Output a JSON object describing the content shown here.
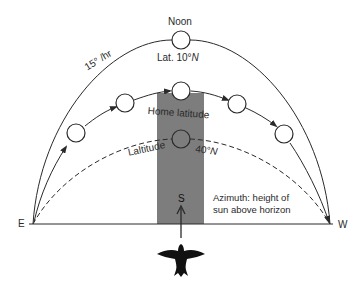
{
  "diagram": {
    "colors": {
      "line": "#2a2a2a",
      "band": "#7d7d7d",
      "background": "#ffffff"
    },
    "labels": {
      "noon": "Noon",
      "rate": "15° /hr",
      "lat_outer": "Lat. 10°",
      "lat_outer_n": "N",
      "home_latitude": "Home latitude",
      "lat_dashed": "Laltitude",
      "lat_dashed_value": "40°",
      "lat_dashed_n": "N",
      "azimuth_line1": "Azimuth: height of",
      "azimuth_line2": "sun above horizon",
      "east": "E",
      "west": "W",
      "south": "S"
    },
    "arcs": [
      {
        "name": "lat-10N-arc",
        "style": "solid",
        "peak_label": "Noon"
      },
      {
        "name": "home-latitude-arc",
        "style": "solid-with-arrows"
      },
      {
        "name": "lat-40N-arc",
        "style": "dashed"
      }
    ],
    "sun_positions": {
      "outer": 1,
      "home": 5,
      "dashed": 1
    },
    "icons": {
      "sun": "sun-circle-icon",
      "bird": "bird-silhouette-icon",
      "arrow": "arrow-up-icon"
    }
  }
}
